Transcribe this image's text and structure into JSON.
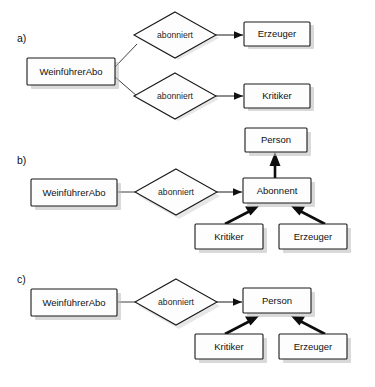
{
  "figure": {
    "kind": "entity-relationship-diagram",
    "background_color": "#ffffff",
    "line_color": "#1a1a1a",
    "box_fill": "#fdfdfd",
    "shadow_color": "#b9b9b9",
    "width": 375,
    "height": 387
  },
  "sections": {
    "a": {
      "label": "a)"
    },
    "b": {
      "label": "b)"
    },
    "c": {
      "label": "c)"
    }
  },
  "entities": {
    "weinfuehrerabo": "WeinführerAbo",
    "erzeuger": "Erzeuger",
    "kritiker": "Kritiker",
    "person": "Person",
    "abonnent": "Abonnent"
  },
  "relationships": {
    "abonniert": "abonniert"
  },
  "variant_a": {
    "section_label": "a)",
    "subscription_entity": "WeinführerAbo",
    "relationships": [
      {
        "name": "abonniert",
        "target": "Erzeuger"
      },
      {
        "name": "abonniert",
        "target": "Kritiker"
      }
    ],
    "targets": [
      "Erzeuger",
      "Kritiker"
    ]
  },
  "variant_b": {
    "section_label": "b)",
    "subscription_entity": "WeinführerAbo",
    "relationship": "abonniert",
    "relationship_target": "Abonnent",
    "supertype": "Person",
    "intermediate": "Abonnent",
    "subtypes": [
      "Kritiker",
      "Erzeuger"
    ],
    "generalizations": [
      {
        "child": "Abonnent",
        "parent": "Person"
      },
      {
        "child": "Kritiker",
        "parent": "Abonnent"
      },
      {
        "child": "Erzeuger",
        "parent": "Abonnent"
      }
    ]
  },
  "variant_c": {
    "section_label": "c)",
    "subscription_entity": "WeinführerAbo",
    "relationship": "abonniert",
    "relationship_target": "Person",
    "supertype": "Person",
    "subtypes": [
      "Kritiker",
      "Erzeuger"
    ],
    "generalizations": [
      {
        "child": "Kritiker",
        "parent": "Person"
      },
      {
        "child": "Erzeuger",
        "parent": "Person"
      }
    ]
  }
}
